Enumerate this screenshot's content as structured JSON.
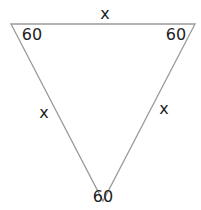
{
  "diagram": {
    "type": "triangle",
    "stroke_color": "#9a9a9a",
    "text_color": "#222222",
    "vertices": {
      "top_left": [
        11,
        24
      ],
      "top_right": [
        195,
        24
      ],
      "bottom": [
        103,
        201
      ]
    },
    "angles": {
      "top_left": "60",
      "top_right": "60",
      "bottom": "60"
    },
    "sides": {
      "top": "x",
      "left": "x",
      "right": "x"
    }
  }
}
